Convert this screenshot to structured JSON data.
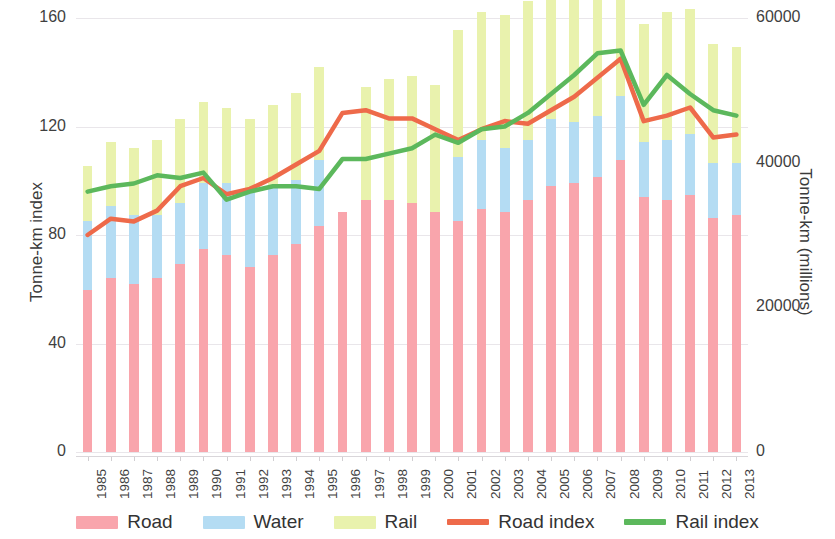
{
  "chart_data": {
    "type": "bar",
    "title": "",
    "subtitle": "",
    "xlabel": "",
    "ylabel": "Tonne-km index",
    "ylabel_right": "Tonne-km (millions)",
    "ylim": [
      0,
      160
    ],
    "ylim_right": [
      0,
      60000
    ],
    "yticks": [
      "0",
      "40",
      "80",
      "120",
      "160"
    ],
    "ytick_values": [
      0,
      40,
      80,
      120,
      160
    ],
    "yticks_right": [
      "0",
      "20000",
      "40000",
      "60000"
    ],
    "ytick_values_right": [
      0,
      20000,
      40000,
      60000
    ],
    "grid": true,
    "legend_position": "bottom",
    "stacked": true,
    "categories": [
      "1985",
      "1986",
      "1987",
      "1988",
      "1989",
      "1990",
      "1991",
      "1992",
      "1993",
      "1994",
      "1995",
      "1996",
      "1997",
      "1998",
      "1999",
      "2000",
      "2001",
      "2002",
      "2003",
      "2004",
      "2005",
      "2006",
      "2007",
      "2008",
      "2009",
      "2010",
      "2011",
      "2012",
      "2013"
    ],
    "series": [
      {
        "name": "Road",
        "kind": "bar",
        "color": "#f9a5ac",
        "axis": "right",
        "values": [
          56,
          60,
          58,
          60,
          65,
          70,
          68,
          64,
          68,
          72,
          78,
          83,
          87,
          87,
          86,
          83,
          80,
          84,
          83,
          87,
          92,
          93,
          95,
          101,
          88,
          87,
          89,
          81,
          82
        ]
      },
      {
        "name": "Water",
        "kind": "bar",
        "color": "#b4dcf3",
        "axis": "right",
        "values": [
          24,
          25,
          24,
          22,
          21,
          23,
          25,
          27,
          24,
          22,
          23,
          0,
          0,
          0,
          0,
          0,
          22,
          24,
          22,
          21,
          23,
          21,
          21,
          22,
          19,
          21,
          21,
          19,
          18
        ]
      },
      {
        "name": "Rail",
        "kind": "bar",
        "color": "#e9f2ad",
        "axis": "right",
        "values": [
          19,
          22,
          23,
          26,
          29,
          28,
          26,
          24,
          28,
          30,
          32,
          0,
          39,
          42,
          44,
          44,
          44,
          44,
          46,
          48,
          51,
          49,
          53,
          37,
          41,
          44,
          43,
          41,
          40
        ]
      },
      {
        "name": "Road index",
        "kind": "line",
        "color": "#ee6a4a",
        "axis": "left",
        "values": [
          80,
          86,
          85,
          89,
          98,
          101,
          95,
          97,
          101,
          106,
          111,
          125,
          126,
          123,
          123,
          119,
          115,
          119,
          122,
          121,
          126,
          131,
          138,
          145,
          122,
          124,
          127,
          116,
          117
        ]
      },
      {
        "name": "Rail index",
        "kind": "line",
        "color": "#5cb85c",
        "axis": "left",
        "values": [
          96,
          98,
          99,
          102,
          101,
          103,
          93,
          96,
          98,
          98,
          97,
          108,
          108,
          110,
          112,
          117,
          114,
          119,
          120,
          125,
          132,
          139,
          147,
          148,
          128,
          139,
          132,
          126,
          124
        ]
      }
    ],
    "legend": [
      {
        "label": "Road",
        "type": "swatch",
        "color": "#f9a5ac"
      },
      {
        "label": "Water",
        "type": "swatch",
        "color": "#b4dcf3"
      },
      {
        "label": "Rail",
        "type": "swatch",
        "color": "#e9f2ad"
      },
      {
        "label": "Road index",
        "type": "line",
        "color": "#ee6a4a"
      },
      {
        "label": "Rail index",
        "type": "line",
        "color": "#5cb85c"
      }
    ]
  }
}
